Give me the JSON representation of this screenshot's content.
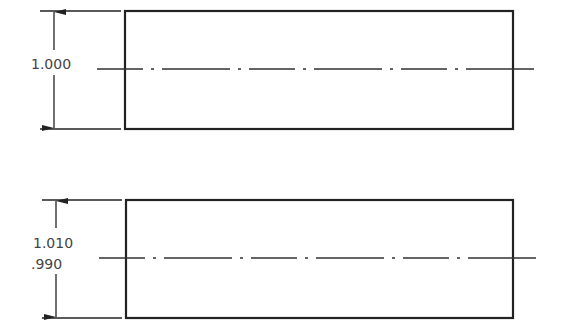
{
  "drawing": {
    "colors": {
      "line": "#222222",
      "text": "#444444",
      "background": "#ffffff"
    },
    "views": [
      {
        "id": "view-basic-dimension",
        "rect": {
          "x": 125,
          "y": 11,
          "w": 388,
          "h": 118
        },
        "centerline": {
          "y": 69,
          "x1": 97,
          "x2": 540
        },
        "dimension": {
          "line_x": 54,
          "ext_x1": 40,
          "ext_x2": 121
        },
        "labels": [
          "1.000"
        ]
      },
      {
        "id": "view-limit-dimension",
        "rect": {
          "x": 126,
          "y": 200,
          "w": 387,
          "h": 118
        },
        "centerline": {
          "y": 258,
          "x1": 99,
          "x2": 541
        },
        "dimension": {
          "line_x": 56,
          "ext_x1": 42,
          "ext_x2": 122
        },
        "labels": [
          "1.010",
          ".990"
        ]
      }
    ]
  }
}
